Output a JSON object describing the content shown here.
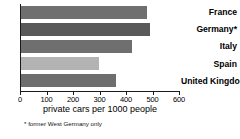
{
  "chart_data": {
    "type": "bar",
    "orientation": "horizontal",
    "title": "",
    "xlabel": "private cars per 1000 people",
    "ylabel": "",
    "xlim": [
      0,
      600
    ],
    "grid": false,
    "legend": null,
    "xticks": [
      0,
      100,
      200,
      300,
      400,
      500,
      600
    ],
    "xtick_labels": [
      "0",
      "100",
      "200",
      "300",
      "400",
      "500",
      "600"
    ],
    "categories": [
      "France",
      "Germany*",
      "Italy",
      "Spain",
      "United Kingdom"
    ],
    "values": [
      475,
      485,
      420,
      295,
      360
    ],
    "bar_colors": [
      "#6f6f6f",
      "#5a5a5a",
      "#6f6f6f",
      "#b3b3b3",
      "#6e6e6e"
    ],
    "annotations": [
      "* former West Germany only"
    ]
  },
  "footnote": "* former West Germany only",
  "axis_label": "private cars per 1000 people"
}
